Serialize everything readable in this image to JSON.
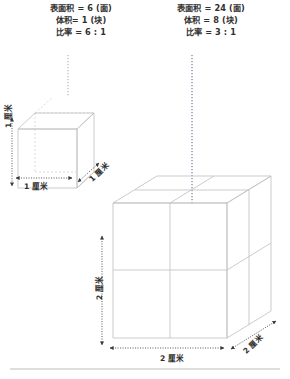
{
  "figure": {
    "title_unit": "厘米",
    "small_cube": {
      "surface_area_line": "表面积 = 6 (面)",
      "volume_line": "体积= 1 (块)",
      "ratio_line": "比率 = 6 : 1",
      "surface_area_value": 6,
      "surface_area_unit": "面",
      "volume_value": 1,
      "volume_unit": "块",
      "ratio": "6 : 1",
      "edge_length": 1,
      "width_label": "1 厘米",
      "height_label": "1 厘米",
      "depth_label": "1 厘米"
    },
    "large_cube": {
      "surface_area_line": "表面积 = 24 (面)",
      "volume_line": "体积 = 8 (块)",
      "ratio_line": "比率 = 3 : 1",
      "surface_area_value": 24,
      "surface_area_unit": "面",
      "volume_value": 8,
      "volume_unit": "块",
      "ratio": "3 : 1",
      "edge_length": 2,
      "width_label": "2 厘米",
      "height_label": "2 厘米",
      "depth_label": "2 厘米"
    }
  },
  "colors": {
    "stroke": "#c9c9c9",
    "stroke_dark": "#b0b0b0",
    "hidden_stroke": "#d8d8d8",
    "arrow": "#3a3a3a",
    "text": "#2e2e2d",
    "rule": "#b4b4b4"
  }
}
